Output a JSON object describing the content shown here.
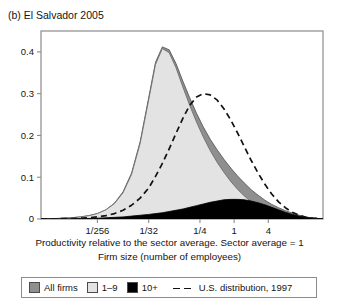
{
  "figure": {
    "panel_label": "(b) El Salvador 2005"
  },
  "axes": {
    "xlabel_line1": "Productivity relative to the sector average. Sector average = 1",
    "xlabel_line2": "Firm size (number of employees)",
    "ylabel": "",
    "xticklabels": [
      "1/256",
      "1/32",
      "1/4",
      "1",
      "4"
    ],
    "yticklabels": [
      "0",
      "0.1",
      "0.2",
      "0.3",
      "0.4"
    ]
  },
  "legend": {
    "items": [
      {
        "label": "All firms",
        "marker": "filled-square",
        "color": "#8f8f8f"
      },
      {
        "label": "1–9",
        "marker": "filled-square",
        "color": "#e3e3e3"
      },
      {
        "label": "10+",
        "marker": "filled-square",
        "color": "#000000"
      },
      {
        "label": "U.S. distribution, 1997",
        "marker": "dashed-line",
        "color": "#111111"
      }
    ]
  },
  "colors": {
    "all_firms": "#8f8f8f",
    "small_firms": "#e3e3e3",
    "large_firms": "#000000",
    "us_distribution": "#111111",
    "axis": "#8c8c8c",
    "text": "#141414"
  },
  "chart_data": {
    "type": "area",
    "title": "(b) El Salvador 2005",
    "xlabel": "Productivity relative to the sector average. Sector average = 1 / Firm size (number of employees)",
    "ylabel": "",
    "xscale": "log2",
    "xlim": [
      -11.3,
      5.2
    ],
    "ylim": [
      0,
      0.45
    ],
    "xtick_values": [
      -8,
      -5,
      -2,
      0,
      2
    ],
    "xticklabels": [
      "1/256",
      "1/32",
      "1/4",
      "1",
      "4"
    ],
    "ytick_values": [
      0,
      0.1,
      0.2,
      0.3,
      0.4
    ],
    "yticklabels": [
      "0",
      "0.1",
      "0.2",
      "0.3",
      "0.4"
    ],
    "grid": false,
    "legend_position": "below-axes",
    "x": [
      -11.3,
      -10.5,
      -10.0,
      -9.5,
      -9.0,
      -8.5,
      -8.0,
      -7.5,
      -7.0,
      -6.5,
      -6.0,
      -5.5,
      -5.0,
      -4.6,
      -4.2,
      -3.8,
      -3.4,
      -3.0,
      -2.6,
      -2.2,
      -1.8,
      -1.4,
      -1.0,
      -0.6,
      -0.2,
      0.2,
      0.6,
      1.0,
      1.4,
      1.8,
      2.2,
      2.6,
      3.0,
      3.4,
      3.8,
      4.2,
      4.6,
      5.0,
      5.2
    ],
    "series": [
      {
        "name": "All firms",
        "type": "area",
        "color": "#8f8f8f",
        "values": [
          0.0,
          0.001,
          0.002,
          0.003,
          0.005,
          0.008,
          0.013,
          0.022,
          0.038,
          0.065,
          0.11,
          0.185,
          0.29,
          0.375,
          0.412,
          0.405,
          0.372,
          0.33,
          0.29,
          0.253,
          0.22,
          0.191,
          0.166,
          0.143,
          0.122,
          0.103,
          0.086,
          0.07,
          0.057,
          0.045,
          0.035,
          0.027,
          0.02,
          0.014,
          0.009,
          0.005,
          0.002,
          0.001,
          0.0
        ]
      },
      {
        "name": "1–9",
        "type": "area",
        "color": "#e3e3e3",
        "values": [
          0.0,
          0.001,
          0.002,
          0.003,
          0.005,
          0.008,
          0.013,
          0.022,
          0.037,
          0.063,
          0.107,
          0.181,
          0.285,
          0.37,
          0.408,
          0.398,
          0.362,
          0.316,
          0.272,
          0.232,
          0.196,
          0.164,
          0.136,
          0.112,
          0.09,
          0.071,
          0.055,
          0.041,
          0.03,
          0.021,
          0.014,
          0.009,
          0.006,
          0.003,
          0.002,
          0.001,
          0.0,
          0.0,
          0.0
        ]
      },
      {
        "name": "10+",
        "type": "area",
        "color": "#000000",
        "values": [
          0.0,
          0.0,
          0.0,
          0.0,
          0.001,
          0.001,
          0.002,
          0.003,
          0.004,
          0.005,
          0.007,
          0.009,
          0.011,
          0.013,
          0.015,
          0.018,
          0.021,
          0.024,
          0.028,
          0.032,
          0.036,
          0.04,
          0.043,
          0.046,
          0.047,
          0.047,
          0.046,
          0.043,
          0.039,
          0.034,
          0.028,
          0.022,
          0.016,
          0.011,
          0.007,
          0.004,
          0.002,
          0.001,
          0.0
        ]
      },
      {
        "name": "U.S. distribution, 1997",
        "type": "line",
        "style": "dashed",
        "color": "#111111",
        "values": [
          0.0,
          0.0,
          0.001,
          0.001,
          0.002,
          0.003,
          0.005,
          0.008,
          0.013,
          0.021,
          0.033,
          0.05,
          0.074,
          0.102,
          0.133,
          0.168,
          0.205,
          0.241,
          0.272,
          0.292,
          0.3,
          0.297,
          0.285,
          0.264,
          0.237,
          0.206,
          0.173,
          0.14,
          0.11,
          0.083,
          0.06,
          0.041,
          0.027,
          0.016,
          0.009,
          0.004,
          0.002,
          0.001,
          0.0
        ]
      }
    ]
  }
}
